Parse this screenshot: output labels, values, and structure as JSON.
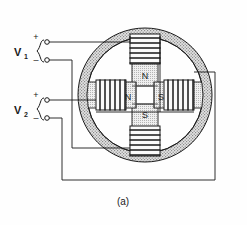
{
  "figure": {
    "caption": "(a)",
    "type": "two-phase-stepper-motor-stator-winding-diagram",
    "background_color": "#fefefe",
    "line_color": "#1a1a1a",
    "iron_fill_color": "#d8d8d8",
    "coil_fill_color": "#f2f2f2"
  },
  "sources": [
    {
      "id": "v1",
      "label": "V",
      "subscript": "1",
      "terminals": [
        {
          "id": "v1-plus",
          "sign": "+"
        },
        {
          "id": "v1-minus",
          "sign": "–"
        }
      ]
    },
    {
      "id": "v2",
      "label": "V",
      "subscript": "2",
      "terminals": [
        {
          "id": "v2-plus",
          "sign": "+"
        },
        {
          "id": "v2-minus",
          "sign": "–"
        }
      ]
    }
  ],
  "poles": [
    {
      "id": "pole-top",
      "position": "top",
      "polarity": "N"
    },
    {
      "id": "pole-left",
      "position": "left",
      "polarity": "N"
    },
    {
      "id": "pole-right",
      "position": "right",
      "polarity": "S"
    },
    {
      "id": "pole-bottom",
      "position": "bottom",
      "polarity": "S"
    }
  ],
  "coils": [
    {
      "id": "coil-top",
      "orientation": "horizontal",
      "turns": 6,
      "phase": "V1"
    },
    {
      "id": "coil-bottom",
      "orientation": "horizontal",
      "turns": 6,
      "phase": "V1"
    },
    {
      "id": "coil-left",
      "orientation": "vertical",
      "turns": 6,
      "phase": "V2"
    },
    {
      "id": "coil-right",
      "orientation": "vertical",
      "turns": 6,
      "phase": "V2"
    }
  ]
}
